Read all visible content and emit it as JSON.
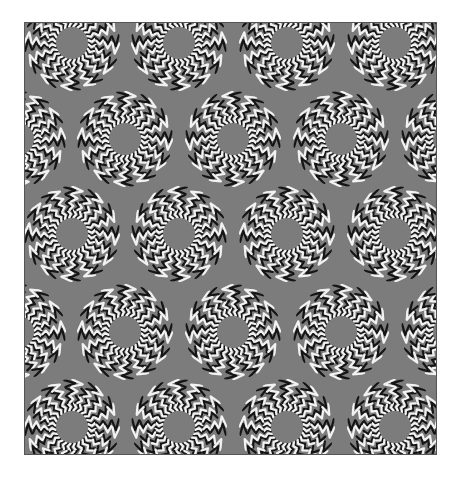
{
  "image": {
    "description": "Optical illusion: grid of disks with zigzag black-and-white chevron rings on gray background",
    "colors": {
      "background": "#7c7c7c",
      "dark": "#151515",
      "light": "#f2f2f2",
      "page": "#ffffff",
      "border": "#555555"
    },
    "frame": {
      "x": 24,
      "y": 22,
      "width": 413,
      "height": 433
    },
    "disk": {
      "outer_radius": 48,
      "inner_radius": 16,
      "rings": 4,
      "chevrons_per_ring": [
        24,
        20,
        16,
        12
      ]
    },
    "rows": [
      {
        "y": 42,
        "xs": [
          71,
          178,
          286,
          394
        ]
      },
      {
        "y": 138,
        "xs": [
          17,
          124,
          232,
          340,
          448
        ]
      },
      {
        "y": 233,
        "xs": [
          71,
          178,
          286,
          394
        ]
      },
      {
        "y": 331,
        "xs": [
          17,
          124,
          232,
          340,
          448
        ]
      },
      {
        "y": 426,
        "xs": [
          71,
          178,
          286,
          394
        ]
      }
    ]
  }
}
